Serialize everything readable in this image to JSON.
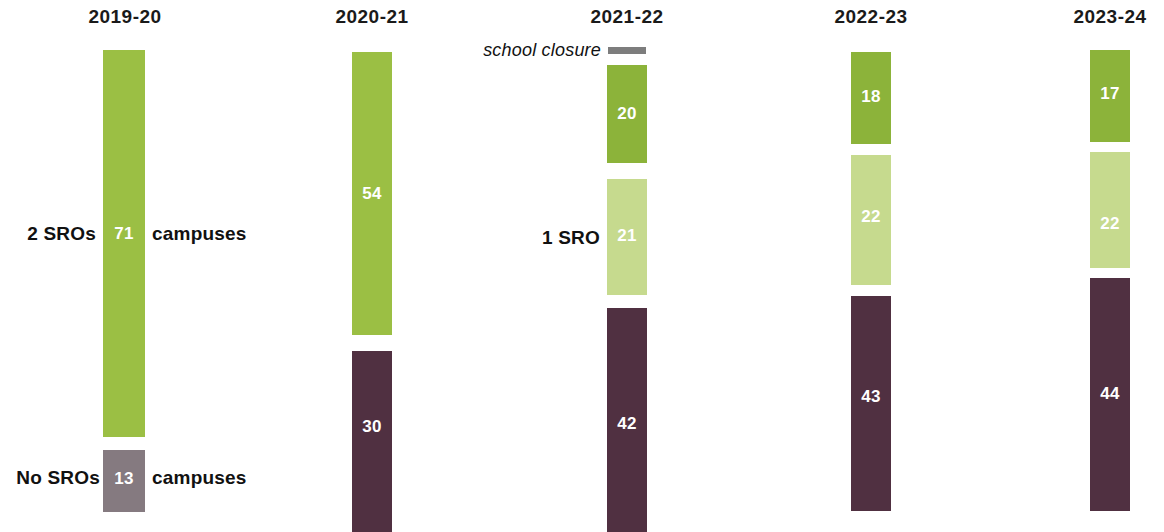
{
  "chart_data": {
    "type": "bar",
    "title": "",
    "subtitle": "",
    "xlabel": "",
    "ylabel": "",
    "categories": [
      "2019-20",
      "2020-21",
      "2021-22",
      "2022-23",
      "2023-24"
    ],
    "series": [
      {
        "name": "2 SROs",
        "values": [
          null,
          null,
          20,
          18,
          17
        ],
        "color": "#8CB33A"
      },
      {
        "name": "1 SRO",
        "values": [
          null,
          null,
          21,
          22,
          22
        ],
        "color": "#C6DA8E"
      },
      {
        "name": "No SROs",
        "values": [
          13,
          30,
          42,
          43,
          44
        ],
        "color": "#503041"
      },
      {
        "name": "2019-20 combined (2 SROs)",
        "values": [
          71,
          54,
          null,
          null,
          null
        ],
        "color": "#9BBF44"
      }
    ],
    "annotations": [
      {
        "text": "school closure",
        "column": "2021-22",
        "style": "italic",
        "marker_color": "#7d7d7d"
      },
      {
        "text": "2 SROs",
        "value_label": "71",
        "suffix": "campuses",
        "column": "2019-20"
      },
      {
        "text": "No SROs",
        "value_label": "13",
        "suffix": "campuses",
        "column": "2019-20"
      },
      {
        "text": "1 SRO",
        "value_label": "21",
        "column": "2021-22"
      }
    ],
    "grid": false,
    "legend": "inline-annotations"
  },
  "colors": {
    "green_mid": "#9BBF44",
    "green_dark": "#8CB33A",
    "green_light": "#C6DA8E",
    "maroon": "#503041",
    "gray_purple": "#857A80",
    "closure_gray": "#7d7d7d",
    "text": "#111111",
    "value_text": "#ffffff",
    "background": "#ffffff"
  },
  "columns": [
    {
      "id": "col-2019-20",
      "year": "2019-20",
      "header_x": 125,
      "bar_x": 103,
      "bar_w": 42,
      "bars": [
        {
          "id": "b-2019-2sro",
          "value": "71",
          "color_key": "green_mid",
          "y": 50,
          "h": 387,
          "label_y": 225,
          "series": "2 SROs"
        },
        {
          "id": "b-2019-nosro",
          "value": "13",
          "color_key": "gray_purple",
          "y": 450,
          "h": 62,
          "label_y": 470,
          "series": "No SROs"
        }
      ]
    },
    {
      "id": "col-2020-21",
      "year": "2020-21",
      "header_x": 372,
      "bar_x": 352,
      "bar_w": 40,
      "bars": [
        {
          "id": "b-2020-2sro",
          "value": "54",
          "color_key": "green_mid",
          "y": 52,
          "h": 283,
          "label_y": 185,
          "series": "2 SROs"
        },
        {
          "id": "b-2020-nosro",
          "value": "30",
          "color_key": "maroon",
          "y": 351,
          "h": 181,
          "label_y": 418,
          "series": "No SROs"
        }
      ]
    },
    {
      "id": "col-2021-22",
      "year": "2021-22",
      "header_x": 627,
      "bar_x": 607,
      "bar_w": 40,
      "bars": [
        {
          "id": "b-2021-2sro",
          "value": "20",
          "color_key": "green_dark",
          "y": 65,
          "h": 98,
          "label_y": 105,
          "series": "2 SROs"
        },
        {
          "id": "b-2021-1sro",
          "value": "21",
          "color_key": "green_light",
          "y": 179,
          "h": 116,
          "label_y": 227,
          "series": "1 SRO"
        },
        {
          "id": "b-2021-nosro",
          "value": "42",
          "color_key": "maroon",
          "y": 308,
          "h": 224,
          "label_y": 415,
          "series": "No SROs"
        }
      ]
    },
    {
      "id": "col-2022-23",
      "year": "2022-23",
      "header_x": 871,
      "bar_x": 851,
      "bar_w": 40,
      "bars": [
        {
          "id": "b-2022-2sro",
          "value": "18",
          "color_key": "green_dark",
          "y": 52,
          "h": 92,
          "label_y": 88,
          "series": "2 SROs"
        },
        {
          "id": "b-2022-1sro",
          "value": "22",
          "color_key": "green_light",
          "y": 155,
          "h": 130,
          "label_y": 208,
          "series": "1 SRO"
        },
        {
          "id": "b-2022-nosro",
          "value": "43",
          "color_key": "maroon",
          "y": 296,
          "h": 215,
          "label_y": 388,
          "series": "No SROs"
        }
      ]
    },
    {
      "id": "col-2023-24",
      "year": "2023-24",
      "header_x": 1110,
      "bar_x": 1090,
      "bar_w": 40,
      "bars": [
        {
          "id": "b-2023-2sro",
          "value": "17",
          "color_key": "green_dark",
          "y": 50,
          "h": 92,
          "label_y": 85,
          "series": "2 SROs"
        },
        {
          "id": "b-2023-1sro",
          "value": "22",
          "color_key": "green_light",
          "y": 152,
          "h": 116,
          "label_y": 215,
          "series": "1 SRO"
        },
        {
          "id": "b-2023-nosro",
          "value": "44",
          "color_key": "maroon",
          "y": 278,
          "h": 233,
          "label_y": 385,
          "series": "No SROs"
        }
      ]
    }
  ],
  "annotations": {
    "two_sros": {
      "text": "2 SROs",
      "x": 96,
      "y": 224
    },
    "campuses_top": {
      "text": "campuses",
      "x": 152,
      "y": 224
    },
    "no_sros": {
      "text": "No SROs",
      "x": 100,
      "y": 468
    },
    "campuses_bottom": {
      "text": "campuses",
      "x": 152,
      "y": 468
    },
    "one_sro": {
      "text": "1 SRO",
      "x": 600,
      "y": 228
    },
    "school_closure": {
      "text": "school closure",
      "x": 601,
      "y": 41,
      "marker_x": 608,
      "marker_y": 47,
      "marker_w": 38,
      "marker_h": 7
    }
  }
}
